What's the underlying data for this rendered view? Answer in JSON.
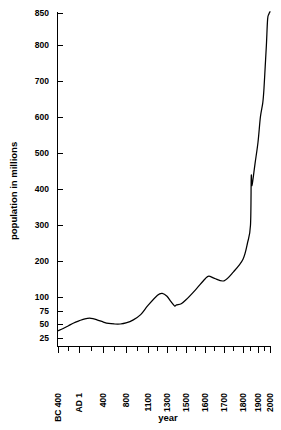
{
  "chart_data": {
    "type": "line",
    "title": "",
    "xlabel": "year",
    "ylabel": "population in millions",
    "grid": false,
    "legend": "none",
    "y_axis": {
      "tick_labels": [
        "25",
        "50",
        "75",
        "100",
        "200",
        "300",
        "400",
        "500",
        "600",
        "700",
        "800",
        "850"
      ],
      "tick_values": [
        25,
        50,
        75,
        100,
        200,
        300,
        400,
        500,
        600,
        700,
        800,
        850
      ],
      "scale_note": "compressed below 100",
      "ylim": [
        25,
        850
      ]
    },
    "x_axis": {
      "tick_labels": [
        "BC 400",
        "AD 1",
        "400",
        "800",
        "1100",
        "1300",
        "1500",
        "1600",
        "1700",
        "1800",
        "1900",
        "2000"
      ],
      "tick_values": [
        -400,
        1,
        400,
        800,
        1100,
        1300,
        1500,
        1600,
        1700,
        1800,
        1900,
        2000
      ],
      "scale_note": "non-uniform compressed at both ends",
      "xlim": [
        -400,
        2000
      ]
    },
    "series": [
      {
        "name": "world population",
        "x": [
          -400,
          -300,
          -200,
          -100,
          1,
          100,
          200,
          300,
          400,
          500,
          600,
          700,
          800,
          900,
          1000,
          1100,
          1200,
          1250,
          1300,
          1340,
          1380,
          1400,
          1450,
          1500,
          1550,
          1600,
          1620,
          1650,
          1700,
          1750,
          1800,
          1830,
          1850,
          1855,
          1860,
          1880,
          1900,
          1920,
          1940,
          1950,
          1960,
          1970,
          1980,
          1990,
          2000
        ],
        "values": [
          38,
          42,
          47,
          52,
          56,
          60,
          61,
          58,
          54,
          51,
          50,
          50,
          52,
          58,
          68,
          85,
          105,
          110,
          102,
          92,
          84,
          86,
          88,
          95,
          120,
          150,
          158,
          152,
          145,
          170,
          205,
          250,
          300,
          435,
          410,
          470,
          530,
          600,
          640,
          680,
          740,
          800,
          840,
          848,
          852
        ]
      }
    ],
    "annotations": [
      {
        "label": "Black Death dip",
        "x": 1350,
        "y": 85
      },
      {
        "label": "mid-19th-century notch",
        "x": 1855,
        "y": 420
      }
    ]
  },
  "labels": {
    "y_axis_title": "population in millions",
    "x_axis_title": "year",
    "y_ticks": [
      "850",
      "800",
      "700",
      "600",
      "500",
      "400",
      "300",
      "200",
      "100",
      "75",
      "50",
      "25"
    ],
    "x_ticks": [
      "BC 400",
      "AD 1",
      "400",
      "800",
      "1100",
      "1300",
      "1500",
      "1600",
      "1700",
      "1800",
      "1900",
      "2000"
    ]
  },
  "colors": {
    "background": "#ffffff",
    "line": "#000000",
    "axis": "#000000",
    "text": "#000000"
  }
}
